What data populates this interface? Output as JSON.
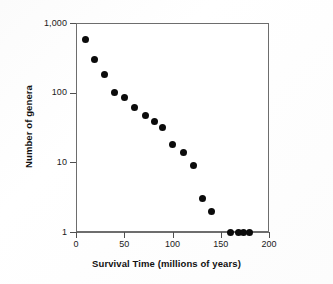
{
  "chart_data": {
    "type": "scatter",
    "title": "",
    "xlabel": "Survival Time (millions of years)",
    "ylabel": "Number of genera",
    "xlim": [
      0,
      200
    ],
    "ylim": [
      1,
      1000
    ],
    "yscale": "log",
    "xscale": "linear",
    "grid": false,
    "legend": false,
    "marker": "filled-circle",
    "marker_color": "#0b0b0b",
    "xticks": [
      0,
      50,
      100,
      150,
      200
    ],
    "xtick_labels": [
      "0",
      "50",
      "100",
      "150",
      "200"
    ],
    "yticks": [
      1,
      10,
      100,
      1000
    ],
    "ytick_labels": [
      "1",
      "10",
      "100",
      "1,000"
    ],
    "x": [
      10,
      19,
      30,
      40,
      50,
      61,
      72,
      81,
      90,
      100,
      111,
      122,
      131,
      140,
      160,
      168,
      174,
      180
    ],
    "y": [
      580,
      300,
      185,
      100,
      84,
      61,
      47,
      39,
      32,
      18,
      14,
      9,
      3,
      2,
      1,
      1,
      1,
      1
    ],
    "points": [
      {
        "x": 10,
        "y": 580
      },
      {
        "x": 19,
        "y": 300
      },
      {
        "x": 30,
        "y": 185
      },
      {
        "x": 40,
        "y": 100
      },
      {
        "x": 50,
        "y": 84
      },
      {
        "x": 61,
        "y": 61
      },
      {
        "x": 72,
        "y": 47
      },
      {
        "x": 81,
        "y": 39
      },
      {
        "x": 90,
        "y": 32
      },
      {
        "x": 100,
        "y": 18
      },
      {
        "x": 111,
        "y": 14
      },
      {
        "x": 122,
        "y": 9
      },
      {
        "x": 131,
        "y": 3
      },
      {
        "x": 140,
        "y": 2
      },
      {
        "x": 160,
        "y": 1
      },
      {
        "x": 168,
        "y": 1
      },
      {
        "x": 174,
        "y": 1
      },
      {
        "x": 180,
        "y": 1
      }
    ]
  }
}
